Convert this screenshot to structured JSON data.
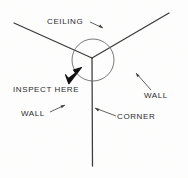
{
  "diagram": {
    "style": "hand-drawn line art, scanned",
    "background_color": "#fdfdfc",
    "ink_color": "#3a3a3a",
    "arrow_color": "#111111",
    "labels": {
      "ceiling": "CEILING",
      "inspect_here": "INSPECT HERE",
      "wall_right": "WALL",
      "wall_left": "WALL",
      "corner": "CORNER"
    },
    "shapes": {
      "junction": "corner-junction",
      "highlight": "inspection-circle",
      "pointer": "inspect-arrow",
      "edge_ceiling_left": "ceiling-wall-edge-left",
      "edge_ceiling_right": "ceiling-wall-edge-right",
      "edge_vertical": "wall-corner-edge"
    },
    "leaders": {
      "ceiling": "ceiling-leader-line",
      "wall_right": "wall-right-leader-line",
      "wall_left": "wall-left-leader-line",
      "corner": "corner-leader-line"
    }
  }
}
